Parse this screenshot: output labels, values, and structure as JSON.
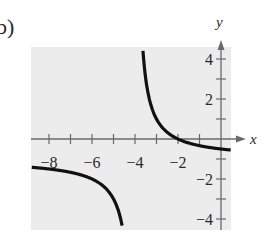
{
  "panel_label": "b)",
  "chart_data": {
    "type": "line",
    "title": "",
    "xlabel": "x",
    "ylabel": "y",
    "function": "f(x) = -(x+2)/(x+4)",
    "vertical_asymptote": -4,
    "horizontal_asymptote": -1,
    "xlim": [
      -8.8,
      0.5
    ],
    "ylim": [
      -4.5,
      4.6
    ],
    "x_ticks": [
      -8,
      -7,
      -6,
      -5,
      -4,
      -3,
      -2,
      -1
    ],
    "x_tick_labels": [
      "-8",
      "-6",
      "-4",
      "-2"
    ],
    "x_tick_label_values": [
      -8,
      -6,
      -4,
      -2
    ],
    "y_ticks": [
      -4,
      -3,
      -2,
      -1,
      1,
      2,
      3,
      4
    ],
    "y_tick_labels": [
      "4",
      "2",
      "-2",
      "-4"
    ],
    "y_tick_label_values": [
      4,
      2,
      -2,
      -4
    ],
    "grid": false,
    "background": "#ececec",
    "series": [
      {
        "name": "left branch",
        "points": [
          [
            -8.8,
            -1.42
          ],
          [
            -8,
            -1.5
          ],
          [
            -7,
            -1.67
          ],
          [
            -6,
            -2.0
          ],
          [
            -5.5,
            -2.33
          ],
          [
            -5,
            -3.0
          ],
          [
            -4.6,
            -4.33
          ]
        ]
      },
      {
        "name": "right branch",
        "points": [
          [
            -3.63,
            4.4
          ],
          [
            -3.5,
            3.0
          ],
          [
            -3,
            1.0
          ],
          [
            -2.5,
            0.33
          ],
          [
            -2,
            0.0
          ],
          [
            -1,
            -0.33
          ],
          [
            0,
            -0.5
          ],
          [
            0.45,
            -0.55
          ]
        ]
      }
    ]
  },
  "colors": {
    "curve": "#111111",
    "axis": "#6a6a6a",
    "plot_bg": "#ececec"
  }
}
